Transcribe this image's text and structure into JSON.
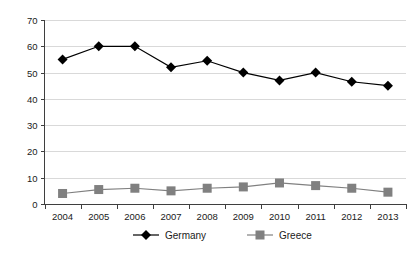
{
  "chart_data": {
    "type": "line",
    "title": "",
    "xlabel": "",
    "ylabel": "",
    "categories": [
      "2004",
      "2005",
      "2006",
      "2007",
      "2008",
      "2009",
      "2010",
      "2011",
      "2012",
      "2013"
    ],
    "ylim": [
      0,
      70
    ],
    "ytick_step": 10,
    "yticks": [
      "0",
      "10",
      "20",
      "30",
      "40",
      "50",
      "60",
      "70"
    ],
    "grid": "horizontal",
    "legend_position": "bottom-center",
    "series": [
      {
        "name": "Germany",
        "marker": "diamond",
        "color": "#000000",
        "values": [
          55,
          60,
          60,
          52,
          54.5,
          50,
          47,
          50,
          46.5,
          45
        ]
      },
      {
        "name": "Greece",
        "marker": "square",
        "color": "#808080",
        "values": [
          4,
          5.5,
          6,
          5,
          6,
          6.5,
          8,
          7,
          6,
          4.5
        ]
      }
    ]
  },
  "legend": {
    "items": [
      {
        "label": "Germany",
        "marker": "diamond-marker",
        "color": "#000000"
      },
      {
        "label": "Greece",
        "marker": "square-marker",
        "color": "#808080"
      }
    ]
  },
  "axes": {
    "gridline_color": "#d9d9d9",
    "axis_color": "#3f3f3f",
    "background": "#ffffff"
  }
}
